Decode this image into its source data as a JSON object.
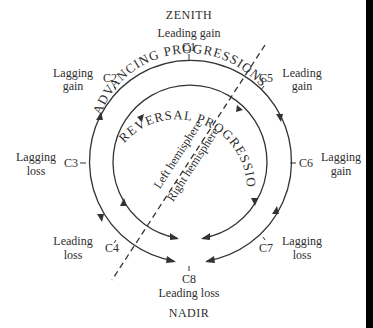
{
  "diagram": {
    "top_label": "ZENITH",
    "bottom_label": "NADIR",
    "outer_ring_title": "ADVANCING PROGRESSIONS",
    "inner_ring_title": "REVERSAL PROGRESSIONS",
    "divider": {
      "left_label": "Left hemisphere",
      "right_label": "Right hemisphere"
    },
    "nodes": [
      {
        "id": "C1",
        "label": "C1",
        "desc_line1": "Leading gain",
        "desc_line2": ""
      },
      {
        "id": "C2",
        "label": "C2",
        "desc_line1": "Lagging",
        "desc_line2": "gain"
      },
      {
        "id": "C3",
        "label": "C3",
        "desc_line1": "Lagging",
        "desc_line2": "loss"
      },
      {
        "id": "C4",
        "label": "C4",
        "desc_line1": "Leading",
        "desc_line2": "loss"
      },
      {
        "id": "C5",
        "label": "C5",
        "desc_line1": "Leading",
        "desc_line2": "gain"
      },
      {
        "id": "C6",
        "label": "C6",
        "desc_line1": "Lagging",
        "desc_line2": "gain"
      },
      {
        "id": "C7",
        "label": "C7",
        "desc_line1": "Lagging",
        "desc_line2": "loss"
      },
      {
        "id": "C8",
        "label": "C8",
        "desc_line1": "Leading loss",
        "desc_line2": ""
      }
    ],
    "colors": {
      "ink": "#2e2e2e",
      "background": "#ffffff",
      "edge_bar": "#000000"
    }
  }
}
